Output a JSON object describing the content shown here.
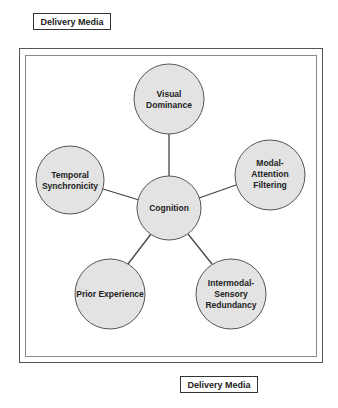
{
  "labels": {
    "top": "Delivery Media",
    "bottom": "Delivery Media"
  },
  "diagram": {
    "center": {
      "lines": [
        "Cognition"
      ]
    },
    "nodes": [
      {
        "lines": [
          "Visual",
          "Dominance"
        ]
      },
      {
        "lines": [
          "Modal-",
          "Attention",
          "Filtering"
        ]
      },
      {
        "lines": [
          "Intermodal-",
          "Sensory",
          "Redundancy"
        ]
      },
      {
        "lines": [
          "Prior Experience"
        ]
      },
      {
        "lines": [
          "Temporal",
          "Synchronicity"
        ]
      }
    ],
    "colors": {
      "node_fill": "#e3e3e3",
      "stroke": "#444444"
    }
  }
}
